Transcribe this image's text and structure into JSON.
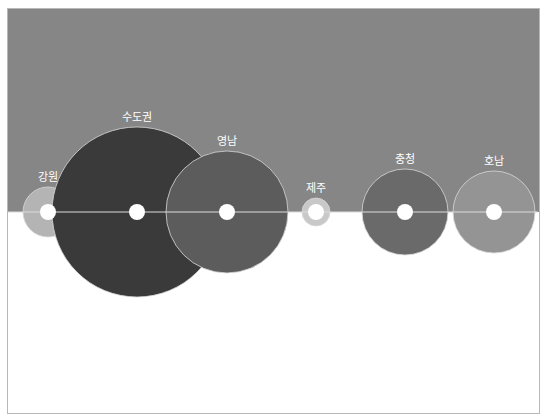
{
  "chart_data": {
    "type": "bubble",
    "title": "",
    "xlabel": "",
    "ylabel": "",
    "baseline_y": 212,
    "background": {
      "top_color": "#868686",
      "bottom_color": "#ffffff",
      "split_y": 211
    },
    "series": [
      {
        "name": "강원",
        "cx": 48,
        "r": 25,
        "color": "#b4b4b4",
        "hole_r": 8
      },
      {
        "name": "수도권",
        "cx": 137,
        "r": 85,
        "color": "#3a3a3a",
        "hole_r": 8
      },
      {
        "name": "영남",
        "cx": 227,
        "r": 61,
        "color": "#5c5c5c",
        "hole_r": 8
      },
      {
        "name": "제주",
        "cx": 316,
        "r": 14,
        "color": "#c8c8c8",
        "hole_r": 8
      },
      {
        "name": "충청",
        "cx": 405,
        "r": 43,
        "color": "#6a6a6a",
        "hole_r": 8
      },
      {
        "name": "호남",
        "cx": 494,
        "r": 41,
        "color": "#949494",
        "hole_r": 8
      }
    ]
  }
}
